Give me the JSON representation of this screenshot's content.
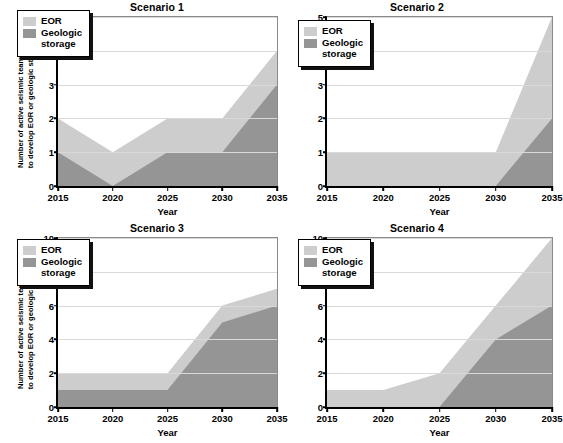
{
  "figure": {
    "background": "#ffffff",
    "colors": {
      "eor": "#cdcdcd",
      "geologic": "#959595",
      "axis": "#000000",
      "grid": "#d9d9d9"
    },
    "y_axis_caption_line1": "Number of active seismic teams required",
    "y_axis_caption_line2": "to develop EOR or geologic storage sites",
    "x_axis_title": "Year",
    "legend": {
      "eor_label": "EOR",
      "geologic_label": "Geologic\nstorage"
    }
  },
  "chart_data": [
    {
      "type": "area",
      "title": "Scenario 1",
      "xlabel": "Year",
      "ylabel": "Number of active seismic teams required to develop EOR or geologic storage sites",
      "categories": [
        "2015",
        "2020",
        "2025",
        "2030",
        "2035"
      ],
      "x": [
        2015,
        2020,
        2025,
        2030,
        2035
      ],
      "xlim": [
        2015,
        2035
      ],
      "ylim": [
        0,
        5
      ],
      "yticks": [
        0,
        1,
        2,
        3,
        4,
        5
      ],
      "grid": true,
      "stacked": true,
      "legend_position": "top-left",
      "series": [
        {
          "name": "Geologic storage",
          "color": "#959595",
          "values": [
            1,
            0,
            1,
            1,
            3
          ]
        },
        {
          "name": "EOR",
          "color": "#cdcdcd",
          "values": [
            1,
            1,
            1,
            1,
            1
          ]
        }
      ],
      "cumulative_totals": [
        2,
        1,
        2,
        2,
        4
      ]
    },
    {
      "type": "area",
      "title": "Scenario 2",
      "xlabel": "Year",
      "ylabel": "",
      "categories": [
        "2015",
        "2020",
        "2025",
        "2030",
        "2035"
      ],
      "x": [
        2015,
        2020,
        2025,
        2030,
        2035
      ],
      "xlim": [
        2015,
        2035
      ],
      "ylim": [
        0,
        5
      ],
      "yticks": [
        0,
        1,
        2,
        3,
        4,
        5
      ],
      "grid": true,
      "stacked": true,
      "legend_position": "top-left",
      "series": [
        {
          "name": "Geologic storage",
          "color": "#959595",
          "values": [
            0,
            0,
            0,
            0,
            2
          ]
        },
        {
          "name": "EOR",
          "color": "#cdcdcd",
          "values": [
            1,
            1,
            1,
            1,
            3
          ]
        }
      ],
      "cumulative_totals": [
        1,
        1,
        1,
        1,
        5
      ]
    },
    {
      "type": "area",
      "title": "Scenario 3",
      "xlabel": "Year",
      "ylabel": "Number of active seismic teams required to develop EOR or geologic storage sites",
      "categories": [
        "2015",
        "2020",
        "2025",
        "2030",
        "2035"
      ],
      "x": [
        2015,
        2020,
        2025,
        2030,
        2035
      ],
      "xlim": [
        2015,
        2035
      ],
      "ylim": [
        0,
        10
      ],
      "yticks": [
        0,
        2,
        4,
        6,
        8,
        10
      ],
      "grid": true,
      "stacked": true,
      "legend_position": "top-left",
      "series": [
        {
          "name": "Geologic storage",
          "color": "#959595",
          "values": [
            1,
            1,
            1,
            5,
            6
          ]
        },
        {
          "name": "EOR",
          "color": "#cdcdcd",
          "values": [
            1,
            1,
            1,
            1,
            1
          ]
        }
      ],
      "cumulative_totals": [
        2,
        2,
        2,
        6,
        7
      ]
    },
    {
      "type": "area",
      "title": "Scenario 4",
      "xlabel": "Year",
      "ylabel": "",
      "categories": [
        "2015",
        "2020",
        "2025",
        "2030",
        "2035"
      ],
      "x": [
        2015,
        2020,
        2025,
        2030,
        2035
      ],
      "xlim": [
        2015,
        2035
      ],
      "ylim": [
        0,
        10
      ],
      "yticks": [
        0,
        2,
        4,
        6,
        8,
        10
      ],
      "grid": true,
      "stacked": true,
      "legend_position": "top-left",
      "series": [
        {
          "name": "Geologic storage",
          "color": "#959595",
          "values": [
            0,
            0,
            0,
            4,
            6
          ]
        },
        {
          "name": "EOR",
          "color": "#cdcdcd",
          "values": [
            1,
            1,
            2,
            2,
            4
          ]
        }
      ],
      "cumulative_totals": [
        1,
        1,
        2,
        6,
        10
      ]
    }
  ]
}
